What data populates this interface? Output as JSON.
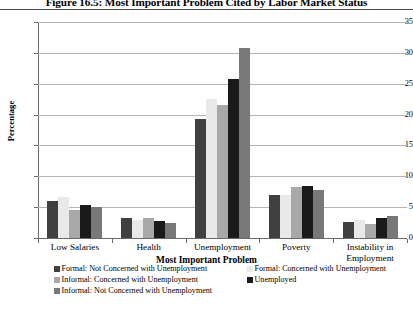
{
  "figure": {
    "title": "Figure 16.5: Most Important Problem Cited by Labor Market Status"
  },
  "chart_data": {
    "type": "bar",
    "title": "Figure 16.5: Most Important Problem Cited by Labor Market Status",
    "xlabel": "Most Important Problem",
    "ylabel": "Percentage",
    "ylim": [
      0,
      35
    ],
    "yticks": [
      0,
      5,
      10,
      15,
      20,
      25,
      30,
      35
    ],
    "ytick_labels": [
      "0",
      "5",
      "10",
      "15",
      "20",
      "25",
      "30",
      "35"
    ],
    "grid": true,
    "legend_position": "bottom",
    "categories": [
      "Low Salaries",
      "Health",
      "Unemployment",
      "Poverty",
      "Instability in Employment"
    ],
    "series": [
      {
        "name": "Formal: Not Concerned with Unemployment",
        "color": "#404040",
        "values": [
          6.0,
          3.3,
          19.3,
          7.0,
          2.6
        ]
      },
      {
        "name": "Formal: Concerned with Unemployment",
        "color": "#e9e9e9",
        "values": [
          6.6,
          3.0,
          22.5,
          7.0,
          3.0
        ]
      },
      {
        "name": "Informal: Concerned with Unemployment",
        "color": "#a8a8a8",
        "values": [
          4.6,
          3.2,
          21.5,
          8.3,
          2.2
        ]
      },
      {
        "name": "Unemployed",
        "color": "#1a1a1a",
        "values": [
          5.3,
          2.7,
          25.8,
          8.5,
          3.2
        ]
      },
      {
        "name": "Informal: Not Concerned with Unemployment",
        "color": "#787878",
        "values": [
          5.0,
          2.5,
          30.8,
          7.8,
          3.5
        ]
      }
    ]
  }
}
